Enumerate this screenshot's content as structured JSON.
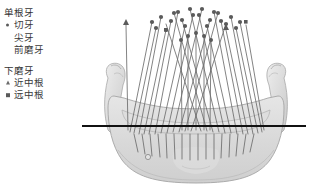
{
  "figure": {
    "title_visible": false,
    "background_color": "#ffffff",
    "bone_color": "#d9d9d9",
    "bone_outline_color": "#9a9a9a",
    "axis_line_color": "#111111",
    "root_line_color": "#6d6d6d",
    "marker_color": "#5a5a5a"
  },
  "legend": {
    "groups": [
      {
        "heading": "单根牙",
        "items": [
          {
            "marker": "dot",
            "label": "切牙"
          },
          {
            "marker": "none",
            "label": "尖牙"
          },
          {
            "marker": "none",
            "label": "前磨牙"
          }
        ]
      },
      {
        "heading": "下磨牙",
        "items": [
          {
            "marker": "triangle",
            "label": "近中根"
          },
          {
            "marker": "square",
            "label": "远中根"
          }
        ]
      }
    ]
  },
  "illustration": {
    "name": "mandible-frontal-view-with-tooth-root-axes",
    "parts": {
      "mandible": "mandible-bone",
      "reference_line": "horizontal-reference-line",
      "mental_foramen": "mental-foramen",
      "root_axes": "tooth-root-long-axis-lines"
    }
  }
}
